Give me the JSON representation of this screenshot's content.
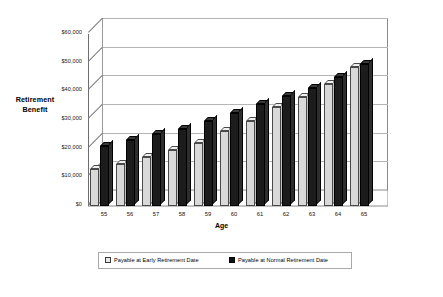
{
  "chart_data": {
    "type": "bar",
    "title": "",
    "xlabel": "Age",
    "ylabel": "Retirement Benefit",
    "categories": [
      "55",
      "56",
      "57",
      "58",
      "59",
      "60",
      "61",
      "62",
      "63",
      "64",
      "65"
    ],
    "ylim": [
      0,
      60000
    ],
    "ytick_values": [
      0,
      10000,
      20000,
      30000,
      40000,
      50000,
      60000
    ],
    "ytick_labels": [
      "$0",
      "$10,000",
      "$20,000",
      "$30,000",
      "$40,000",
      "$50,000",
      "$60,000"
    ],
    "grid": true,
    "legend_position": "bottom",
    "style": "3d-clustered-column",
    "series": [
      {
        "name": "Payable at Early Retirement Date",
        "color": "#d9d9d9",
        "values": [
          13000,
          14500,
          17000,
          19500,
          22000,
          26000,
          29500,
          34500,
          38000,
          42500,
          48500
        ]
      },
      {
        "name": "Payable at Normal Retirement Date",
        "color": "#1c1c1c",
        "values": [
          21000,
          23000,
          25000,
          27000,
          29500,
          32500,
          35500,
          38500,
          41000,
          45000,
          49500
        ]
      }
    ]
  },
  "axis": {
    "y_title_line1": "Retirement",
    "y_title_line2": "Benefit",
    "x_title": "Age"
  },
  "legend": {
    "items": [
      {
        "label": "Payable at Early Retirement Date",
        "swatch": "early"
      },
      {
        "label": "Payable at Normal Retirement Date",
        "swatch": "normal"
      }
    ]
  }
}
